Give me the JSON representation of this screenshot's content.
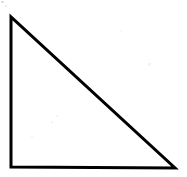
{
  "image": {
    "title": "Right triangle geometric figure",
    "width": 187,
    "height": 177,
    "background_color": "#ffffff",
    "stroke_color": "#000000",
    "stroke_width": 3,
    "style": "scanned line drawing",
    "caption": ""
  },
  "figure": {
    "name": "right-triangle",
    "shape_type": "triangle",
    "classification": "right triangle",
    "orientation": "right angle at bottom-left, hypotenuse from top-left to bottom-right",
    "filled": false,
    "fill_color": "none",
    "vertices": [
      {
        "label": "apex-top-left",
        "x": 11,
        "y": 17
      },
      {
        "label": "right-angle-bottom-left",
        "x": 11,
        "y": 167
      },
      {
        "label": "bottom-right",
        "x": 175,
        "y": 168
      }
    ],
    "edges": [
      {
        "label": "vertical-leg",
        "from": "apex-top-left",
        "to": "right-angle-bottom-left"
      },
      {
        "label": "horizontal-leg",
        "from": "right-angle-bottom-left",
        "to": "bottom-right"
      },
      {
        "label": "hypotenuse",
        "from": "bottom-right",
        "to": "apex-top-left"
      }
    ],
    "path": "M 11 17 L 11 167 L 175 168 Z"
  },
  "artifacts": {
    "description": "faint scanner speckles on white paper",
    "color": "#c8c8c8",
    "marks": [
      {
        "x": 1,
        "y": 1,
        "w": 3,
        "h": 2,
        "opacity": 0.55
      },
      {
        "x": 5,
        "y": 5,
        "w": 2,
        "h": 2,
        "opacity": 0.3
      },
      {
        "x": 148,
        "y": 63,
        "w": 3,
        "h": 3,
        "opacity": 0.22
      },
      {
        "x": 56,
        "y": 115,
        "w": 2,
        "h": 2,
        "opacity": 0.2
      },
      {
        "x": 51,
        "y": 121,
        "w": 2,
        "h": 2,
        "opacity": 0.18
      },
      {
        "x": 31,
        "y": 136,
        "w": 2,
        "h": 2,
        "opacity": 0.15
      },
      {
        "x": 120,
        "y": 30,
        "w": 2,
        "h": 2,
        "opacity": 0.14
      }
    ]
  }
}
